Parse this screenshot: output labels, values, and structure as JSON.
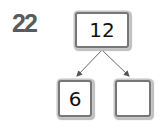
{
  "question": {
    "number": "22"
  },
  "number_bond": {
    "whole": "12",
    "parts": [
      "6",
      ""
    ]
  },
  "colors": {
    "question_number": "#5a5a5a",
    "box_border": "#777777",
    "arrow": "#555555"
  }
}
